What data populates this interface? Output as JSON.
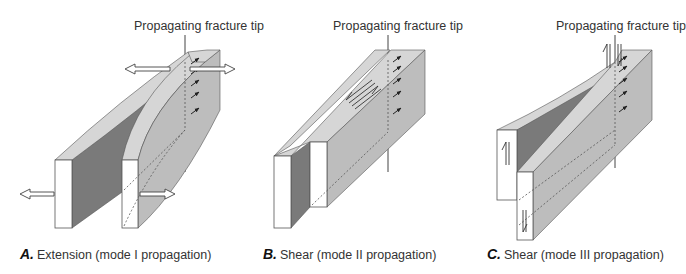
{
  "panels": [
    {
      "id": "A",
      "tip_label": "Propagating fracture tip",
      "caption_letter": "A.",
      "caption_text": "Extension (mode I propagation)"
    },
    {
      "id": "B",
      "tip_label": "Propagating fracture tip",
      "caption_letter": "B.",
      "caption_text": "Shear (mode II propagation)"
    },
    {
      "id": "C",
      "tip_label": "Propagating fracture tip",
      "caption_letter": "C.",
      "caption_text": "Shear (mode III propagation)"
    }
  ],
  "colors": {
    "top_face": "#d6d6d6",
    "side_face": "#bdbdbd",
    "dark_face": "#7a7a7a",
    "front_face": "#ffffff",
    "outline": "#555555"
  }
}
